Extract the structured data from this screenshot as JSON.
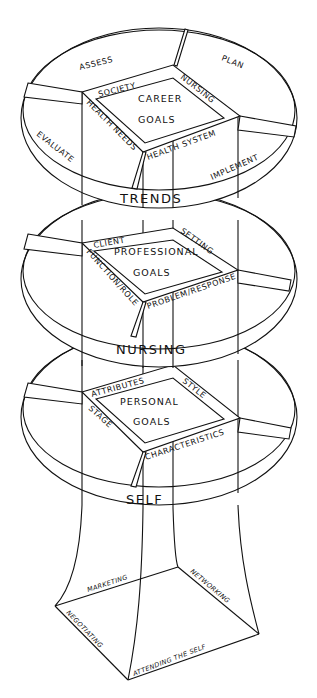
{
  "diagram": {
    "type": "stacked-tier-model",
    "tiers": [
      {
        "id": "career",
        "ring_label": "TRENDS",
        "center_lines": [
          "CAREER",
          "GOALS"
        ],
        "square_edges": [
          "SOCIETY",
          "NURSING",
          "HEALTH NEEDS",
          "HEALTH SYSTEM"
        ],
        "rim_sections": [
          "ASSESS",
          "PLAN",
          "EVALUATE",
          "IMPLEMENT"
        ]
      },
      {
        "id": "professional",
        "ring_label": "NURSING",
        "center_lines": [
          "PROFESSIONAL",
          "GOALS"
        ],
        "square_edges": [
          "CLIENT",
          "SETTING",
          "FUNCTION/ROLE",
          "PROBLEM/RESPONSE"
        ]
      },
      {
        "id": "personal",
        "ring_label": "SELF",
        "center_lines": [
          "PERSONAL",
          "GOALS"
        ],
        "square_edges": [
          "ATTRIBUTES",
          "STYLE",
          "STAGE",
          "CHARACTERISTICS"
        ]
      }
    ],
    "base": {
      "edges": [
        "MARKETING",
        "NETWORKING",
        "NEGOTIATING",
        "ATTENDING THE SELF"
      ]
    }
  }
}
